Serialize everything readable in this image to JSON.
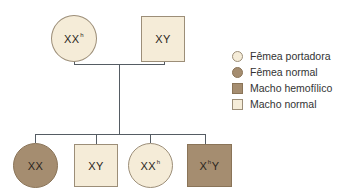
{
  "diagram": {
    "type": "pedigree",
    "colors": {
      "light_fill": "#f5ecd8",
      "dark_fill": "#a58d70",
      "line": "#555c63"
    },
    "parents": {
      "mother": {
        "shape": "circle",
        "fill": "light",
        "genotype_base": "XX",
        "genotype_sup": "h"
      },
      "father": {
        "shape": "square",
        "fill": "light",
        "genotype_base": "XY",
        "genotype_sup": ""
      }
    },
    "children": [
      {
        "shape": "circle",
        "fill": "dark",
        "genotype_pre": "XX",
        "genotype_sup": "",
        "genotype_post": ""
      },
      {
        "shape": "square",
        "fill": "light",
        "genotype_pre": "XY",
        "genotype_sup": "",
        "genotype_post": ""
      },
      {
        "shape": "circle",
        "fill": "light",
        "genotype_pre": "XX",
        "genotype_sup": "h",
        "genotype_post": ""
      },
      {
        "shape": "square",
        "fill": "dark",
        "genotype_pre": "X",
        "genotype_sup": "h",
        "genotype_post": "Y"
      }
    ]
  },
  "legend": {
    "items": [
      {
        "icon": "light-circle-icon",
        "label": "Fêmea portadora"
      },
      {
        "icon": "dark-circle-icon",
        "label": "Fêmea normal"
      },
      {
        "icon": "dark-square-icon",
        "label": "Macho hemofílico"
      },
      {
        "icon": "light-square-icon",
        "label": "Macho normal"
      }
    ]
  }
}
